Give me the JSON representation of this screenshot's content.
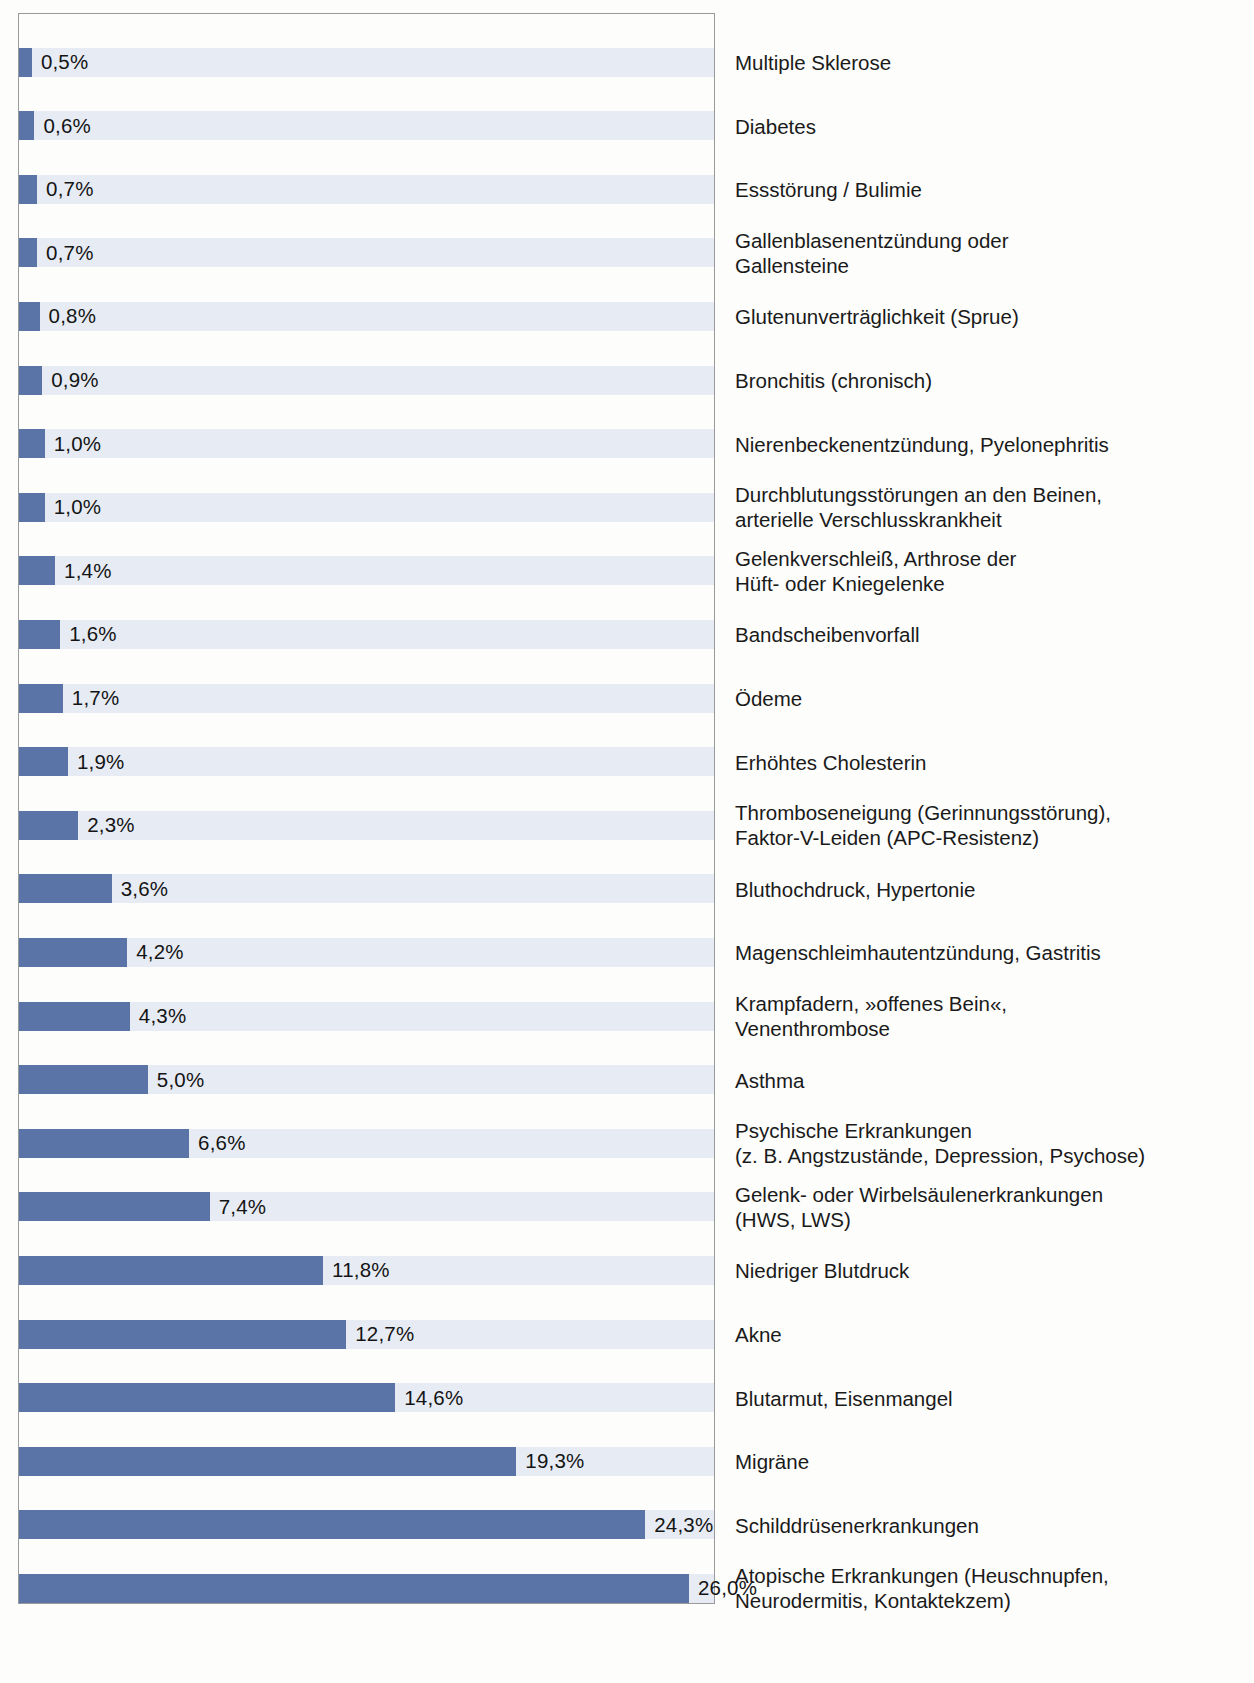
{
  "chart_data": {
    "type": "bar",
    "orientation": "horizontal",
    "title": "",
    "subtitle": "",
    "xlabel": "",
    "ylabel": "",
    "xlim": [
      0,
      26.0
    ],
    "grid": false,
    "legend": null,
    "value_suffix": "%",
    "decimal_separator": ",",
    "bar_color": "#5a74a8",
    "stripe_color": "#e7ecf4",
    "frame_color": "#9a9a9a",
    "categories": [
      "Multiple Sklerose",
      "Diabetes",
      "Essstörung / Bulimie",
      "Gallenblasenentzündung oder\nGallensteine",
      "Glutenunverträglichkeit (Sprue)",
      "Bronchitis (chronisch)",
      "Nierenbeckenentzündung, Pyelonephritis",
      "Durchblutungsstörungen an den Beinen,\narterielle Verschlusskrankheit",
      "Gelenkverschleiß, Arthrose der\nHüft- oder Kniegelenke",
      "Bandscheibenvorfall",
      "Ödeme",
      "Erhöhtes Cholesterin",
      "Thromboseneigung (Gerinnungsstörung),\nFaktor-V-Leiden (APC-Resistenz)",
      "Bluthochdruck, Hypertonie",
      "Magenschleimhautentzündung, Gastritis",
      "Krampfadern, »offenes Bein«,\nVenenthrombose",
      "Asthma",
      "Psychische Erkrankungen\n(z. B. Angstzustände, Depression, Psychose)",
      "Gelenk- oder Wirbelsäulenerkrankungen\n(HWS, LWS)",
      "Niedriger Blutdruck",
      "Akne",
      "Blutarmut, Eisenmangel",
      "Migräne",
      "Schilddrüsenerkrankungen",
      "Atopische Erkrankungen (Heuschnupfen,\nNeurodermitis, Kontaktekzem)"
    ],
    "values": [
      0.5,
      0.6,
      0.7,
      0.7,
      0.8,
      0.9,
      1.0,
      1.0,
      1.4,
      1.6,
      1.7,
      1.9,
      2.3,
      3.6,
      4.2,
      4.3,
      5.0,
      6.6,
      7.4,
      11.8,
      12.7,
      14.6,
      19.3,
      24.3,
      26.0
    ],
    "value_labels": [
      "0,5%",
      "0,6%",
      "0,7%",
      "0,7%",
      "0,8%",
      "0,9%",
      "1,0%",
      "1,0%",
      "1,4%",
      "1,6%",
      "1,7%",
      "1,9%",
      "2,3%",
      "3,6%",
      "4,2%",
      "4,3%",
      "5,0%",
      "6,6%",
      "7,4%",
      "11,8%",
      "12,7%",
      "14,6%",
      "19,3%",
      "24,3%",
      "26,0%"
    ]
  }
}
